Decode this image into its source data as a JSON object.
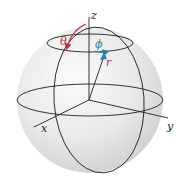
{
  "diagram": {
    "axes": {
      "x": {
        "label": "x"
      },
      "y": {
        "label": "y"
      },
      "z": {
        "label": "z"
      }
    },
    "coordinates": {
      "theta": {
        "label": "θ",
        "color": "#c0304a"
      },
      "phi": {
        "label": "ϕ",
        "color": "#2a7fa8"
      },
      "r": {
        "label": "r",
        "color": "#c0304a"
      }
    },
    "colors": {
      "sphere_fill": "#e6e6e6",
      "sphere_highlight": "#f7f7f7",
      "line": "#1e1e1e",
      "vector": "#2a7fa8"
    }
  }
}
